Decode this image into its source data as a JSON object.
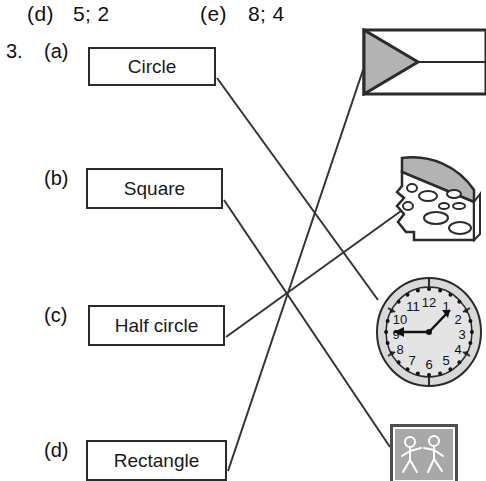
{
  "header": {
    "answers": [
      {
        "letter": "(d)",
        "value": "5; 2"
      },
      {
        "letter": "(e)",
        "value": "8; 4"
      }
    ]
  },
  "question": {
    "number": "3.",
    "items": [
      {
        "letter": "(a)",
        "label": "Circle"
      },
      {
        "letter": "(b)",
        "label": "Square"
      },
      {
        "letter": "(c)",
        "label": "Half circle"
      },
      {
        "letter": "(d)",
        "label": "Rectangle"
      }
    ]
  },
  "pictures": [
    {
      "name": "flag",
      "description": "Flag with gray triangle"
    },
    {
      "name": "cheese-wedge",
      "description": "Cheese wedge with holes"
    },
    {
      "name": "clock",
      "description": "Analog clock face"
    },
    {
      "name": "school-crossing-sign",
      "description": "School crossing sign with two children"
    }
  ],
  "clock": {
    "numerals": [
      "1",
      "2",
      "3",
      "4",
      "5",
      "6",
      "7",
      "8",
      "9",
      "10",
      "11",
      "12"
    ]
  },
  "connections": [
    {
      "from": "Circle",
      "to": "clock"
    },
    {
      "from": "Square",
      "to": "school-crossing-sign"
    },
    {
      "from": "Half circle",
      "to": "cheese-wedge"
    },
    {
      "from": "Rectangle",
      "to": "flag"
    }
  ],
  "colors": {
    "ink": "#2b2b2b",
    "line": "#333333",
    "fill_gray": "#b3b3b3",
    "light_gray": "#d9d9d9",
    "paper": "#ffffff"
  }
}
